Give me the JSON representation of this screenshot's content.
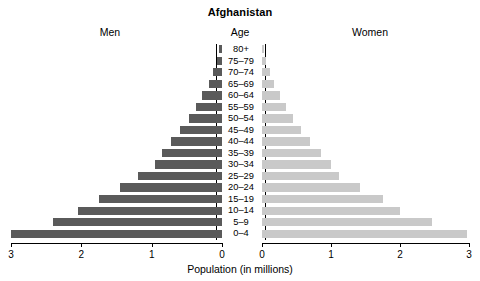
{
  "chart_data": {
    "type": "bar",
    "subtype": "population-pyramid",
    "title": "Afghanistan",
    "xlabel": "Population (in millions)",
    "ylabel": "Age",
    "left_label": "Men",
    "right_label": "Women",
    "center_label": "Age",
    "categories": [
      "80+",
      "75–79",
      "70–74",
      "65–69",
      "60–64",
      "55–59",
      "50–54",
      "45–49",
      "40–44",
      "35–39",
      "30–34",
      "25–29",
      "20–24",
      "15–19",
      "10–14",
      "5–9",
      "0–4"
    ],
    "series": [
      {
        "name": "Men",
        "color": "#5a5a5a",
        "side": "left",
        "values": [
          0.04,
          0.07,
          0.13,
          0.19,
          0.28,
          0.37,
          0.47,
          0.6,
          0.72,
          0.85,
          0.95,
          1.2,
          1.45,
          1.75,
          2.05,
          2.4,
          3.0
        ]
      },
      {
        "name": "Women",
        "color": "#c9c9c9",
        "side": "right",
        "values": [
          0.03,
          0.06,
          0.11,
          0.18,
          0.26,
          0.35,
          0.45,
          0.57,
          0.7,
          0.85,
          1.0,
          1.12,
          1.42,
          1.75,
          2.0,
          2.47,
          2.97
        ]
      }
    ],
    "xlim_left": [
      3,
      0
    ],
    "xlim_right": [
      0,
      3
    ],
    "left_ticks": [
      "3",
      "2",
      "1",
      "0"
    ],
    "right_ticks": [
      "0",
      "1",
      "2",
      "3"
    ],
    "left_tick_values": [
      3,
      2,
      1,
      0
    ],
    "right_tick_values": [
      0,
      1,
      2,
      3
    ],
    "grid": false,
    "legend": "none"
  }
}
